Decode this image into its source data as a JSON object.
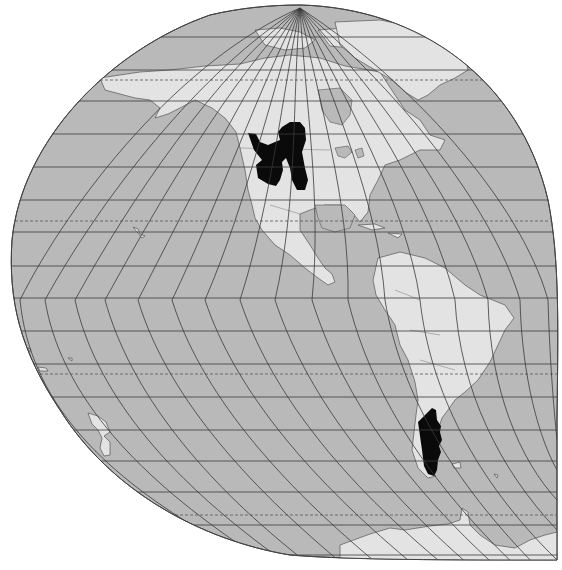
{
  "map": {
    "title": "",
    "projection": "oblique globe projection centered on the Americas",
    "colors": {
      "ocean": "#b9b9b9",
      "land": "#e3e3e3",
      "highlight_range": "#0a0a0a",
      "graticule": "#3a3a3a",
      "background": "#ffffff"
    },
    "highlighted_regions": [
      {
        "name": "Western North America (Great Plains / Rocky Mountain region)"
      },
      {
        "name": "Patagonia (southern Argentina)"
      }
    ],
    "visible_landmasses": [
      "North America",
      "Greenland",
      "Central America",
      "Caribbean",
      "South America",
      "Antarctica",
      "Hawaii",
      "New Zealand",
      "Aleutian Islands",
      "Falkland Islands",
      "South Georgia"
    ],
    "special_parallels_dashed": [
      "Arctic Circle",
      "Tropic of Cancer",
      "Tropic of Capricorn",
      "Antarctic Circle"
    ]
  }
}
